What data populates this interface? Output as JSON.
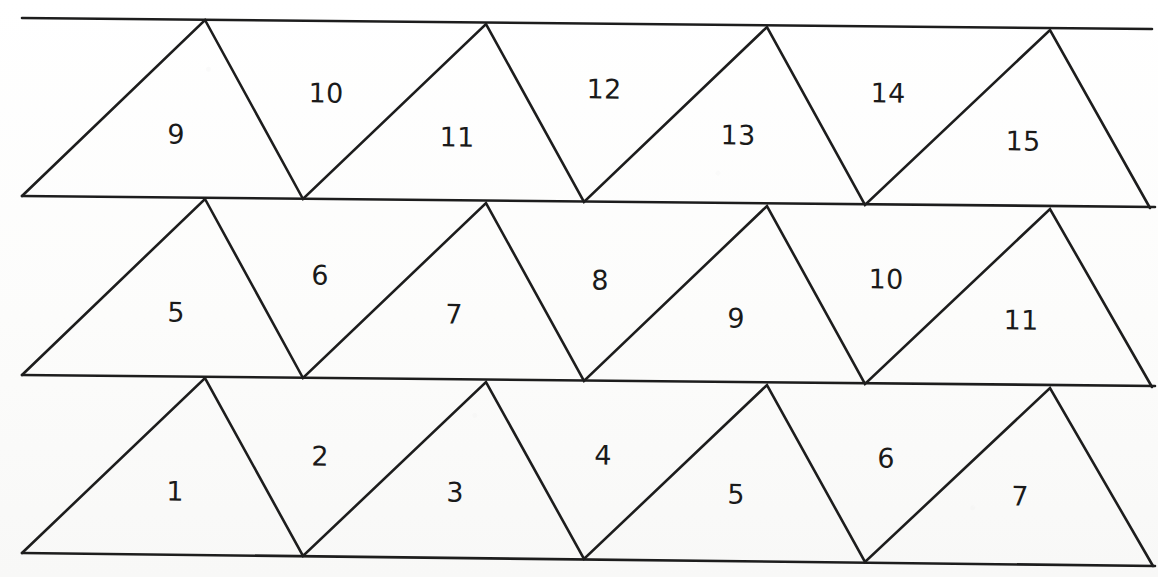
{
  "figure": {
    "background_color": "#ffffff",
    "stroke_color": "#1d1d1d",
    "label_color": "#1a1a1a",
    "tilt_degrees": 0.62,
    "rows": [
      {
        "row_name": "top-row",
        "labels": [
          "9",
          "10",
          "11",
          "12",
          "13",
          "14",
          "15"
        ],
        "orientations": [
          "up",
          "down",
          "up",
          "down",
          "up",
          "down",
          "up"
        ]
      },
      {
        "row_name": "middle-row",
        "labels": [
          "5",
          "6",
          "7",
          "8",
          "9",
          "10",
          "11"
        ],
        "orientations": [
          "up",
          "down",
          "up",
          "down",
          "up",
          "down",
          "up"
        ]
      },
      {
        "row_name": "bottom-row",
        "labels": [
          "1",
          "2",
          "3",
          "4",
          "5",
          "6",
          "7"
        ],
        "orientations": [
          "up",
          "down",
          "up",
          "down",
          "up",
          "down",
          "up"
        ]
      }
    ]
  },
  "labels": {
    "top": {
      "t0": "9",
      "t1": "10",
      "t2": "11",
      "t3": "12",
      "t4": "13",
      "t5": "14",
      "t6": "15"
    },
    "middle": {
      "m0": "5",
      "m1": "6",
      "m2": "7",
      "m3": "8",
      "m4": "9",
      "m5": "10",
      "m6": "11"
    },
    "bottom": {
      "b0": "1",
      "b1": "2",
      "b2": "3",
      "b3": "4",
      "b4": "5",
      "b5": "6",
      "b6": "7"
    }
  },
  "geometry": {
    "left_x": 22,
    "right_x": 1155,
    "row_top_baseline_y": 18,
    "row_mid_baseline_y": 196,
    "row_low_baseline_y": 375,
    "row_bottom_baseline_y": 553,
    "apex_spacing": 281,
    "first_apex_x": 205
  }
}
